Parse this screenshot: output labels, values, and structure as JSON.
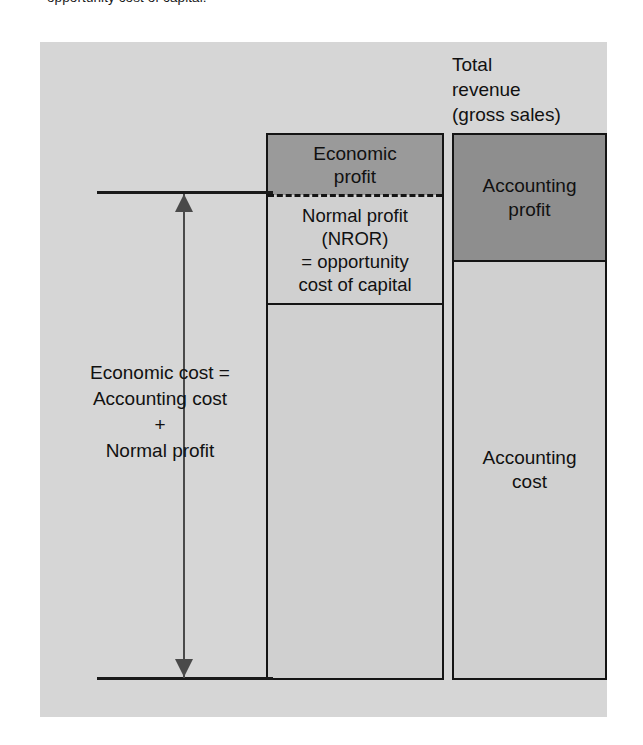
{
  "caption": {
    "text": "opportunity cost of capital."
  },
  "figure": {
    "type": "stacked-bar-diagram",
    "panel_background": "#d6d6d6",
    "right_bar_heading": {
      "lines": [
        "Total",
        "revenue",
        "(gross sales)"
      ],
      "full": "Total revenue (gross sales)"
    },
    "left_bar": {
      "name": "economic-cost-bar",
      "segments": [
        {
          "id": "economic-profit",
          "lines": [
            "Economic",
            "profit"
          ],
          "full": "Economic profit",
          "fill": "#9a9a9a",
          "share_pct": 11
        },
        {
          "id": "normal-profit",
          "lines": [
            "Normal profit",
            "(NROR)",
            "= opportunity",
            "cost of capital"
          ],
          "full": "Normal profit (NROR) = opportunity cost of capital",
          "fill": "#d0d0d0",
          "share_pct": 20
        },
        {
          "id": "economic-cost-remainder",
          "lines": [],
          "full": "",
          "fill": "#d0d0d0",
          "share_pct": 69
        }
      ],
      "divider_style": "dashed"
    },
    "right_bar": {
      "name": "total-revenue-bar",
      "segments": [
        {
          "id": "accounting-profit",
          "lines": [
            "Accounting",
            "profit"
          ],
          "full": "Accounting profit",
          "fill": "#8e8e8e",
          "share_pct": 23
        },
        {
          "id": "accounting-cost",
          "lines": [
            "Accounting",
            "cost"
          ],
          "full": "Accounting cost",
          "fill": "#d0d0d0",
          "share_pct": 77
        }
      ]
    },
    "measure_label": {
      "lines": [
        "Economic cost =",
        "Accounting cost",
        "+",
        "Normal profit"
      ],
      "full": "Economic cost = Accounting cost + Normal profit"
    },
    "colors": {
      "panel": "#d6d6d6",
      "light_fill": "#d0d0d0",
      "dark_fill": "#9a9a9a",
      "mid_fill": "#8e8e8e",
      "outline": "#141414",
      "arrow": "#4a4a4a"
    }
  }
}
